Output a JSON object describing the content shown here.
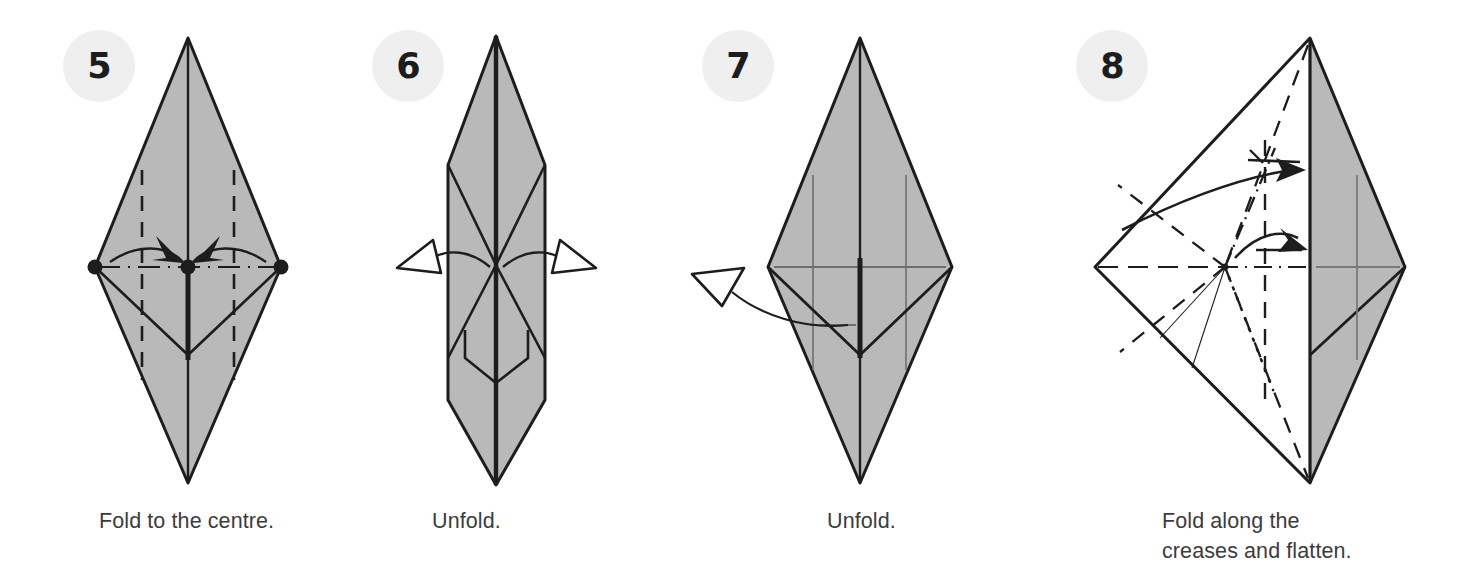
{
  "page": {
    "background": "#ffffff",
    "paper_fill": "#b9b9b9",
    "paper_stroke": "#1d1d1d",
    "badge_bg": "#efefef",
    "badge_text_color": "#1d1d1d",
    "caption_color": "#3c3c3c"
  },
  "steps": [
    {
      "number": "5",
      "badge_name": "step-badge-5",
      "caption": "Fold to the centre.",
      "shape": "tall vertical diamond (kite) with centre vertical crease",
      "markers": [
        "left-vertex-dot",
        "centre-dot",
        "right-vertex-dot"
      ],
      "creases": [
        "left vertical dashed valley crease",
        "right vertical dashed valley crease",
        "horizontal dash-dot centre line"
      ],
      "arrows": [
        "solid fold arrow pointing right-to-centre",
        "solid fold arrow pointing left-to-centre"
      ]
    },
    {
      "number": "6",
      "badge_name": "step-badge-6",
      "caption": "Unfold.",
      "shape": "narrow elongated vertical spindle, folded flaps",
      "markers": [],
      "creases": [
        "centre vertical fold line",
        "diagonal flap edges"
      ],
      "arrows": [
        "hollow unfold arrow pointing left",
        "hollow unfold arrow pointing right"
      ]
    },
    {
      "number": "7",
      "badge_name": "step-badge-7",
      "caption": "Unfold.",
      "shape": "tall vertical diamond with lower V flap",
      "markers": [],
      "creases": [
        "left vertical grey crease",
        "right vertical grey crease",
        "horizontal grey crease"
      ],
      "arrows": [
        "hollow unfold arrow pointing up-left"
      ]
    },
    {
      "number": "8",
      "badge_name": "step-badge-8",
      "caption": "Fold along the\ncreases and flatten.",
      "shape": "wide kite, white left half and grey right half",
      "markers": [
        "centre crease intersection node"
      ],
      "creases": [
        "dashed valley creases",
        "dash-dot mountain creases",
        "dotted creases",
        "thin solid reference lines",
        "horizontal centre dashed line",
        "vertical centre dashed line"
      ],
      "arrows": [
        "solid fold arrow upper pointing right",
        "solid fold arrow lower pointing right"
      ]
    }
  ]
}
